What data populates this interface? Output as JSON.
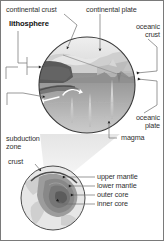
{
  "figure": {
    "kind": "geology-cross-section-diagram",
    "background_color": "#ffffff",
    "border_color": "#7a7a7a",
    "text_color": "#2f2f2f",
    "leader_line_color": "#6d6d6d",
    "palette": {
      "continental_crust": "#585858",
      "upper_layer": "#8e8e8e",
      "mantle_mid": "#a8a8a8",
      "mantle_deep": "#c9c9c9",
      "sky_land": "#d9d9d9",
      "ocean": "#b4b4b4",
      "globe_mantle": "#9a9a9a",
      "globe_outer_core": "#8a8a8a",
      "globe_inner_core": "#6f6f6f",
      "globe_surface": "#e2e2e2",
      "magma_plume": "#efefef",
      "cone_beam": "#e6e6e6"
    }
  },
  "labels": {
    "continental_crust": "continental crust",
    "continental_plate": "continental plate",
    "lithosphere": "lithosphere",
    "oceanic_crust_line1": "oceanic",
    "oceanic_crust_line2": "crust",
    "oceanic_plate_line1": "oceanic",
    "oceanic_plate_line2": "plate",
    "magma": "magma",
    "subduction_zone_line1": "subduction",
    "subduction_zone_line2": "zone",
    "crust": "crust",
    "upper_mantle": "upper mantle",
    "lower_mantle": "lower mantle",
    "outer_core": "outer core",
    "inner_core": "inner core"
  },
  "label_list": [
    {
      "id": "continental-crust",
      "text": "continental crust",
      "bold": false,
      "target": "upper-left of cross-section circle"
    },
    {
      "id": "continental-plate",
      "text": "continental plate",
      "bold": false,
      "target": "top-center of cross-section circle"
    },
    {
      "id": "lithosphere",
      "text": "lithosphere",
      "bold": true,
      "target": "left bracket into cross-section circle"
    },
    {
      "id": "oceanic-crust",
      "text": "oceanic crust",
      "bold": false,
      "target": "right edge upper arrow"
    },
    {
      "id": "oceanic-plate",
      "text": "oceanic plate",
      "bold": false,
      "target": "right edge lower arrow"
    },
    {
      "id": "magma",
      "text": "magma",
      "bold": false,
      "target": "magma plume beneath ridge"
    },
    {
      "id": "subduction-zone",
      "text": "subduction zone",
      "bold": false,
      "target": "left descending slab"
    },
    {
      "id": "crust",
      "text": "crust",
      "bold": false,
      "target": "globe surface shell"
    },
    {
      "id": "upper-mantle",
      "text": "upper mantle",
      "bold": false,
      "target": "globe cutaway layer 1"
    },
    {
      "id": "lower-mantle",
      "text": "lower mantle",
      "bold": false,
      "target": "globe cutaway layer 2"
    },
    {
      "id": "outer-core",
      "text": "outer core",
      "bold": false,
      "target": "globe cutaway layer 3"
    },
    {
      "id": "inner-core",
      "text": "inner core",
      "bold": false,
      "target": "globe cutaway center"
    }
  ]
}
